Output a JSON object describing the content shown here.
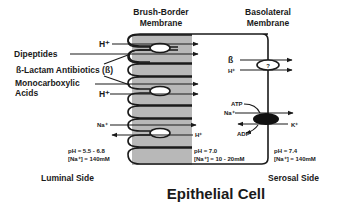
{
  "headers": {
    "brush_border_line1": "Brush-Border",
    "brush_border_line2": "Membrane",
    "basolateral_line1": "Basolateral",
    "basolateral_line2": "Membrane"
  },
  "luminal_labels": {
    "h_top": "H⁺",
    "dipeptides": "Dipeptides",
    "beta_lactam": "ß-Lactam Antibiotics (ß)",
    "monocarboxylic_line1": "Monocarboxylic",
    "monocarboxylic_line2": "Acids",
    "h_mid": "H⁺",
    "na": "Na⁺",
    "h_exchange": "H⁺"
  },
  "basolateral_labels": {
    "beta": "ß",
    "h": "H⁺",
    "unknown_transporter": "?",
    "atp": "ATP",
    "na": "Na⁺",
    "k": "K⁺",
    "adp": "ADP"
  },
  "conditions": {
    "luminal_ph": "pH = 5.5 - 6.8",
    "luminal_na": "[Na⁺] = 140mM",
    "cell_ph": "pH = 7.0",
    "cell_na": "[Na⁺] = 10 - 20mM",
    "serosal_ph": "pH = 7.4",
    "serosal_na": "[Na⁺] = 140mM"
  },
  "sides": {
    "luminal": "Luminal Side",
    "serosal": "Serosal Side"
  },
  "title": "Epithelial Cell",
  "colors": {
    "membrane_shade": "#b8b8b8",
    "line": "#1a1a1a",
    "pump": "#111111",
    "background": "#ffffff"
  }
}
